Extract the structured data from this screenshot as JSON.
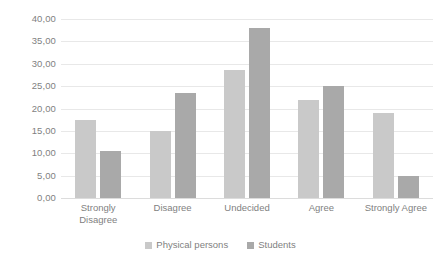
{
  "chart_data": {
    "type": "bar",
    "title": "",
    "xlabel": "",
    "ylabel": "",
    "categories": [
      "Strongly Disagree",
      "Disagree",
      "Undecided",
      "Agree",
      "Strongly Agree"
    ],
    "series": [
      {
        "name": "Physical persons",
        "color": "#c9c9c9",
        "values": [
          17.5,
          15.0,
          28.5,
          22.0,
          19.0
        ]
      },
      {
        "name": "Students",
        "color": "#a9a9a9",
        "values": [
          10.5,
          23.5,
          38.0,
          25.0,
          5.0
        ]
      }
    ],
    "ylim": [
      0,
      40
    ],
    "ytick_step": 5,
    "ytick_labels": [
      "0,00",
      "5,00",
      "10,00",
      "15,00",
      "20,00",
      "25,00",
      "30,00",
      "35,00",
      "40,00"
    ],
    "ytick_values": [
      0,
      5,
      10,
      15,
      20,
      25,
      30,
      35,
      40
    ],
    "grid": true,
    "grid_color": "#e8e8e8",
    "legend_position": "bottom-center",
    "background": "#ffffff"
  }
}
